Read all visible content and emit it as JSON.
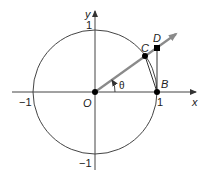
{
  "diagram": {
    "axes": {
      "x_label": "x",
      "y_label": "y",
      "x_tick_pos": "1",
      "x_tick_neg": "−1",
      "y_tick_pos": "1",
      "y_tick_neg": "−1"
    },
    "points": {
      "origin": "O",
      "b": "B",
      "c": "C",
      "d": "D"
    },
    "angle_label": "θ",
    "colors": {
      "line": "#444444",
      "ray": "#8a8a8a",
      "point": "#000000"
    }
  }
}
